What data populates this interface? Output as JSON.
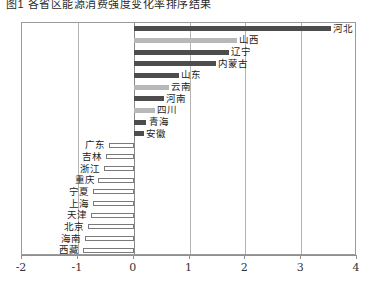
{
  "caption": {
    "text": "图1  各省区能源消费强度变化率排序结果"
  },
  "chart_data": {
    "type": "bar",
    "orientation": "horizontal",
    "title": "",
    "subtitle": "",
    "xlabel": "",
    "ylabel": "",
    "xlim": [
      -2,
      4
    ],
    "xticks": [
      -2,
      -1,
      0,
      1,
      2,
      3,
      4
    ],
    "xticklabels": [
      "-2",
      "-1",
      "0",
      "1",
      "2",
      "3",
      "4"
    ],
    "grid": true,
    "gridlines_at": [
      -1,
      0,
      1,
      2,
      3
    ],
    "legend": "none",
    "categories": [
      "河北",
      "山西",
      "辽宁",
      "内蒙古",
      "山东",
      "云南",
      "河南",
      "四川",
      "青海",
      "安徽",
      "广东",
      "吉林",
      "浙江",
      "重庆",
      "宁夏",
      "上海",
      "天津",
      "北京",
      "海南",
      "西藏"
    ],
    "values": [
      3.53,
      1.85,
      1.7,
      1.47,
      0.81,
      0.63,
      0.54,
      0.39,
      0.23,
      0.18,
      -0.45,
      -0.49,
      -0.53,
      -0.63,
      -0.72,
      -0.73,
      -0.77,
      -0.81,
      -0.88,
      -0.91
    ],
    "bar_styles": [
      "dark",
      "light",
      "dark",
      "dark",
      "dark",
      "light",
      "dark",
      "light",
      "dark",
      "dark",
      "hollow",
      "hollow",
      "hollow",
      "hollow",
      "hollow",
      "hollow",
      "hollow",
      "hollow",
      "hollow",
      "hollow"
    ],
    "colors": {
      "dark": "#4d4d4d",
      "light": "#b8b8b8",
      "hollow_fill": "#ffffff",
      "hollow_stroke": "#7a7a7a",
      "frame": "#9a9a9a",
      "gridline": "#b4b4b4",
      "zeroline": "#8a8a8a",
      "text": "#1c1c1c"
    }
  }
}
